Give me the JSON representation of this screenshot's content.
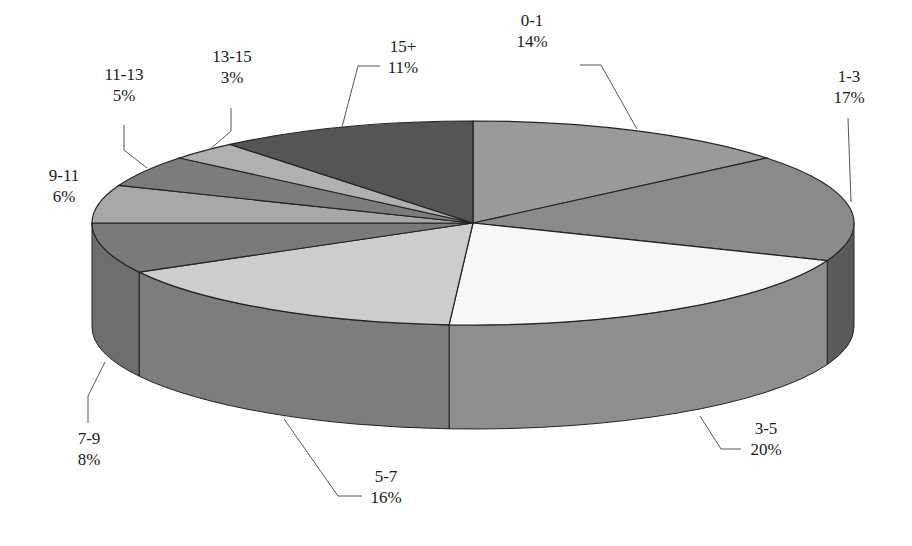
{
  "chart_data": {
    "type": "pie",
    "style": "3d",
    "title": "",
    "legend": "none",
    "categories": [
      "0-1",
      "1-3",
      "3-5",
      "5-7",
      "7-9",
      "9-11",
      "11-13",
      "13-15",
      "15+"
    ],
    "values": [
      14,
      17,
      20,
      16,
      8,
      6,
      5,
      3,
      11
    ],
    "labels": [
      "14%",
      "17%",
      "20%",
      "16%",
      "8%",
      "6%",
      "5%",
      "3%",
      "11%"
    ],
    "colors": [
      "#9a9a9a",
      "#8a8a8a",
      "#f7f7f7",
      "#cdcdcd",
      "#7a7a7a",
      "#a8a8a8",
      "#7c7c7c",
      "#b0b0b0",
      "#555555"
    ]
  },
  "labels": [
    {
      "name": "0-1",
      "pct": "14%"
    },
    {
      "name": "1-3",
      "pct": "17%"
    },
    {
      "name": "3-5",
      "pct": "20%"
    },
    {
      "name": "5-7",
      "pct": "16%"
    },
    {
      "name": "7-9",
      "pct": "8%"
    },
    {
      "name": "9-11",
      "pct": "6%"
    },
    {
      "name": "11-13",
      "pct": "5%"
    },
    {
      "name": "13-15",
      "pct": "3%"
    },
    {
      "name": "15+",
      "pct": "11%"
    }
  ]
}
